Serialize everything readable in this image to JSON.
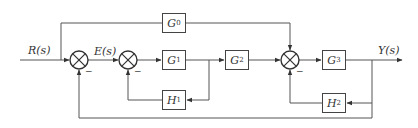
{
  "diagram": {
    "type": "control-system block diagram",
    "input_label": "R(s)",
    "error_label": "E(s)",
    "output_label": "Y(s)",
    "blocks": [
      {
        "id": "G0",
        "label": "G",
        "sub": "0"
      },
      {
        "id": "G1",
        "label": "G",
        "sub": "1"
      },
      {
        "id": "G2",
        "label": "G",
        "sub": "2"
      },
      {
        "id": "G3",
        "label": "G",
        "sub": "3"
      },
      {
        "id": "H1",
        "label": "H",
        "sub": "1"
      },
      {
        "id": "H2",
        "label": "H",
        "sub": "2"
      }
    ],
    "summing_junctions": [
      {
        "id": "S1",
        "inputs": [
          "R(s) +",
          "Y(s) -"
        ]
      },
      {
        "id": "S2",
        "inputs": [
          "E(s) +",
          "H1 -"
        ]
      },
      {
        "id": "S3",
        "inputs": [
          "G2 +",
          "G0 +",
          "H2 -"
        ]
      }
    ],
    "minus_sign": "−",
    "line_color": "#444444"
  }
}
